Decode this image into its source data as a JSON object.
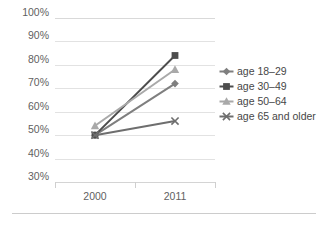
{
  "chart_data": {
    "type": "line",
    "title": "",
    "subtitle": "",
    "xlabel": "",
    "ylabel": "",
    "categories": [
      "2000",
      "2011"
    ],
    "x_tick_labels": [
      "2000",
      "2011"
    ],
    "y_tick_labels": [
      "100%",
      "90%",
      "80%",
      "70%",
      "60%",
      "50%",
      "40%",
      "30%"
    ],
    "y_tick_values": [
      100,
      90,
      80,
      70,
      60,
      50,
      40,
      30
    ],
    "ylim": [
      30,
      100
    ],
    "y_unit": "%",
    "grid": true,
    "legend_position": "right",
    "series": [
      {
        "name": "age 18–29",
        "values": [
          50,
          72
        ],
        "color": "#7f7f7f",
        "marker": "diamond"
      },
      {
        "name": "age 30–49",
        "values": [
          50,
          84
        ],
        "color": "#4d4d4d",
        "marker": "square"
      },
      {
        "name": "age 50–64",
        "values": [
          54,
          78
        ],
        "color": "#a9a9a9",
        "marker": "triangle"
      },
      {
        "name": "age 65 and older",
        "values": [
          50,
          56
        ],
        "color": "#6e6e6e",
        "marker": "x"
      }
    ]
  },
  "legend": {
    "entries": [
      {
        "label": "age 18–29"
      },
      {
        "label": "age 30–49"
      },
      {
        "label": "age 50–64"
      },
      {
        "label": "age 65 and older"
      }
    ]
  },
  "colors": {
    "gridline": "#e2e2e2",
    "axis": "#d4d4d4",
    "text": "#5f5f5f",
    "background": "#ffffff"
  }
}
